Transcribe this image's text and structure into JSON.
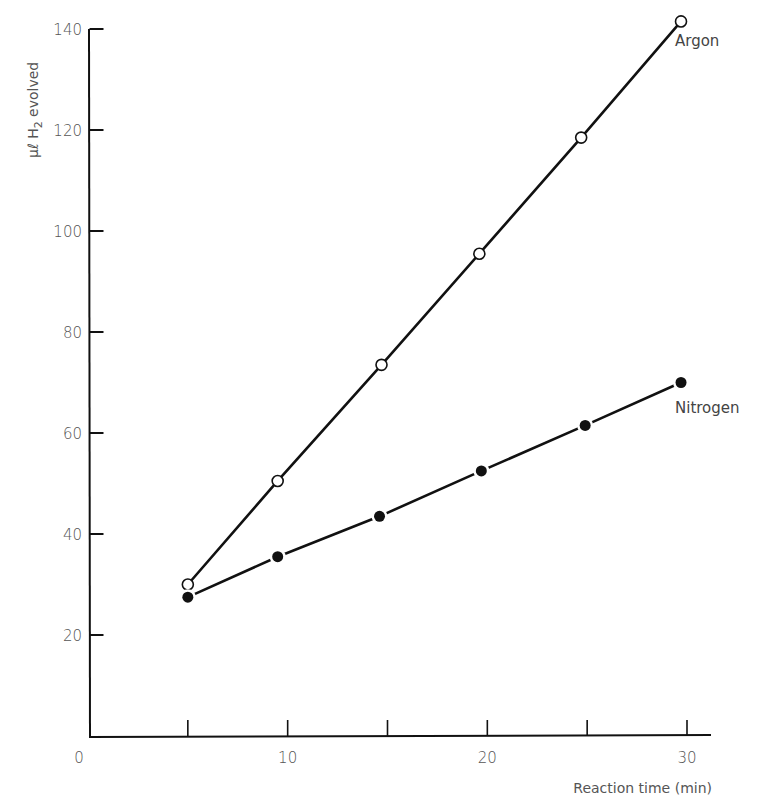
{
  "chart_data": {
    "type": "line",
    "title": "",
    "xlabel": "Reaction time (min)",
    "ylabel": "μℓ H2 evolved",
    "ylabel_parts": {
      "prefix": "μℓ",
      "main": "H",
      "sub": "2",
      "suffix": "evolved"
    },
    "xlim": [
      0,
      31
    ],
    "ylim": [
      0,
      140
    ],
    "x_ticks": [
      5,
      10,
      15,
      20,
      25,
      30
    ],
    "x_tick_labels": [
      "10",
      "20",
      "30"
    ],
    "x_tick_label_values": [
      10,
      20,
      30
    ],
    "origin_label": "0",
    "y_ticks": [
      20,
      40,
      60,
      80,
      100,
      120,
      140
    ],
    "y_tick_labels": [
      "20",
      "40",
      "60",
      "80",
      "100",
      "120",
      "140"
    ],
    "grid": false,
    "legend": "inline labels at line ends",
    "series": [
      {
        "name": "Argon",
        "marker": "open-circle",
        "x": [
          5,
          9.5,
          14.7,
          19.6,
          24.7,
          29.7
        ],
        "values": [
          30,
          50.5,
          73.5,
          95.5,
          118.5,
          141.5
        ]
      },
      {
        "name": "Nitrogen",
        "marker": "filled-circle",
        "x": [
          5,
          9.5,
          14.6,
          19.7,
          24.9,
          29.7
        ],
        "values": [
          27.5,
          35.5,
          43.5,
          52.5,
          61.5,
          70
        ]
      }
    ]
  },
  "colors": {
    "line": "#111111",
    "text": "#555555",
    "background": "#ffffff"
  }
}
